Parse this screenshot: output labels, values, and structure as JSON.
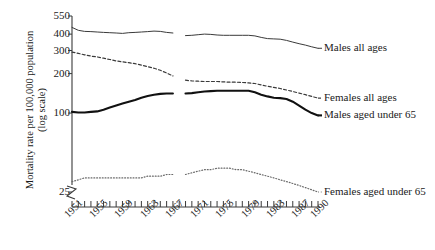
{
  "chart_data": {
    "type": "line",
    "title": "",
    "xlabel": "",
    "ylabel": "Mortality rate per 100,000 population",
    "ylabel_line2": "(log scale)",
    "yscale": "log",
    "ylim": [
      25,
      550
    ],
    "xlim": [
      1951,
      1990
    ],
    "grid": false,
    "legend_position": "inline-right",
    "axis_break": "y-axis break below 25",
    "ytick_labels": [
      "550",
      "400",
      "300",
      "200",
      "100",
      "25"
    ],
    "ytick_values": [
      550,
      400,
      300,
      200,
      100,
      25
    ],
    "xtick_labels": [
      "1951",
      "1955",
      "1959",
      "1963",
      "1967",
      "1971",
      "1975",
      "1979",
      "1983",
      "1987",
      "1990"
    ],
    "xtick_values": [
      1951,
      1955,
      1959,
      1963,
      1967,
      1971,
      1975,
      1979,
      1983,
      1987,
      1990
    ],
    "x_minor_ticks_every": 1,
    "x": [
      1951,
      1952,
      1953,
      1954,
      1955,
      1956,
      1957,
      1958,
      1959,
      1960,
      1961,
      1962,
      1963,
      1964,
      1965,
      1966,
      1967,
      1968,
      1969,
      1970,
      1971,
      1972,
      1973,
      1974,
      1975,
      1976,
      1977,
      1978,
      1979,
      1980,
      1981,
      1982,
      1983,
      1984,
      1985,
      1986,
      1987,
      1988,
      1989,
      1990
    ],
    "series": [
      {
        "name": "Males all ages",
        "style": "solid-thin",
        "color": "#3a3a3a",
        "break_after_year": 1967,
        "values": [
          450,
          428,
          420,
          418,
          415,
          412,
          410,
          408,
          405,
          410,
          412,
          415,
          418,
          422,
          420,
          412,
          408,
          null,
          390,
          392,
          396,
          400,
          398,
          394,
          392,
          392,
          392,
          392,
          392,
          388,
          378,
          370,
          368,
          366,
          358,
          348,
          338,
          330,
          320,
          312
        ]
      },
      {
        "name": "Females all ages",
        "style": "dashed",
        "color": "#3a3a3a",
        "break_after_year": 1967,
        "values": [
          292,
          285,
          278,
          272,
          268,
          262,
          256,
          250,
          246,
          242,
          238,
          232,
          226,
          220,
          212,
          202,
          192,
          null,
          178,
          176,
          175,
          174,
          174,
          174,
          173,
          172,
          172,
          171,
          170,
          168,
          164,
          160,
          157,
          154,
          150,
          146,
          142,
          138,
          134,
          130
        ]
      },
      {
        "name": "Males aged under 65",
        "style": "solid-thick",
        "color": "#111111",
        "break_after_year": 1967,
        "values": [
          102,
          101,
          101,
          102,
          103,
          106,
          110,
          114,
          118,
          122,
          126,
          131,
          135,
          138,
          140,
          141,
          141,
          null,
          141,
          142,
          144,
          146,
          147,
          148,
          148,
          148,
          148,
          148,
          148,
          144,
          138,
          134,
          131,
          130,
          128,
          122,
          114,
          106,
          100,
          96
        ]
      },
      {
        "name": "Females aged under 65",
        "style": "dotted",
        "color": "#6a6a6a",
        "break_after_year": 1967,
        "values": [
          30,
          31,
          32,
          32,
          32,
          32,
          32,
          32,
          32,
          32,
          32,
          32,
          33,
          33,
          33,
          34,
          34,
          null,
          34,
          35,
          36,
          37,
          37,
          38,
          38,
          38,
          37,
          37,
          36,
          35,
          34,
          33,
          32,
          31,
          30,
          29,
          28,
          27,
          26,
          25
        ]
      }
    ]
  }
}
